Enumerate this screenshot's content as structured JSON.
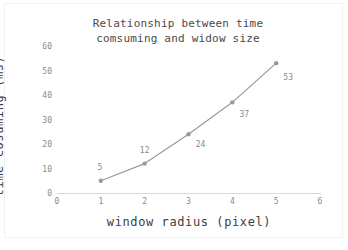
{
  "chart_data": {
    "type": "line",
    "title": "Relationship between time\ncomsuming and widow size",
    "xlabel": "window radius (pixel)",
    "ylabel": "time cosuming (ms)",
    "x": [
      1,
      2,
      3,
      4,
      5
    ],
    "values": [
      5,
      12,
      24,
      37,
      53
    ],
    "point_labels": [
      "5",
      "12",
      "24",
      "37",
      "53"
    ],
    "xlim": [
      0,
      6
    ],
    "ylim": [
      0,
      60
    ],
    "xticks": [
      "0",
      "1",
      "2",
      "3",
      "4",
      "5",
      "6"
    ],
    "yticks": [
      "0",
      "10",
      "20",
      "30",
      "40",
      "50",
      "60"
    ],
    "grid": false,
    "legend": false,
    "series_color": "#9a9a9a",
    "marker_color": "#9a9a9a",
    "axis_color": "#d8d8d8",
    "tick_label_color": "#8a8a8a",
    "title_color": "#4a4a4a",
    "axis_title_color": "#3d3d3d",
    "background": "#ffffff"
  }
}
